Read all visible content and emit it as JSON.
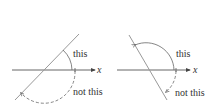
{
  "panels": [
    {
      "axis_label": "x",
      "solid_angle_label": "this",
      "dashed_angle_label": "not this"
    },
    {
      "axis_label": "x",
      "solid_angle_label": "this",
      "dashed_angle_label": "not this"
    }
  ],
  "colors": {
    "line": "#888888",
    "axis": "#444444",
    "text": "#333333",
    "background": "#ffffff"
  }
}
